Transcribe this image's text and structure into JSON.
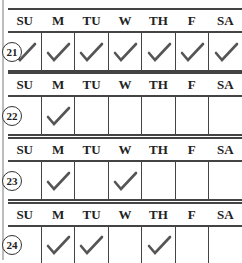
{
  "day_headers": [
    "SU",
    "M",
    "TU",
    "W",
    "TH",
    "F",
    "SA"
  ],
  "rows": [
    {
      "number": "21",
      "checks": [
        true,
        true,
        true,
        true,
        true,
        true,
        true
      ]
    },
    {
      "number": "22",
      "checks": [
        false,
        true,
        false,
        false,
        false,
        false,
        false
      ]
    },
    {
      "number": "23",
      "checks": [
        false,
        true,
        false,
        true,
        false,
        false,
        false
      ]
    },
    {
      "number": "24",
      "checks": [
        false,
        true,
        true,
        false,
        true,
        false,
        false
      ]
    }
  ],
  "colors": {
    "check": "#555555",
    "border": "#444444",
    "leftbar": "#bdbdbd"
  },
  "icon": "checkmark-icon"
}
